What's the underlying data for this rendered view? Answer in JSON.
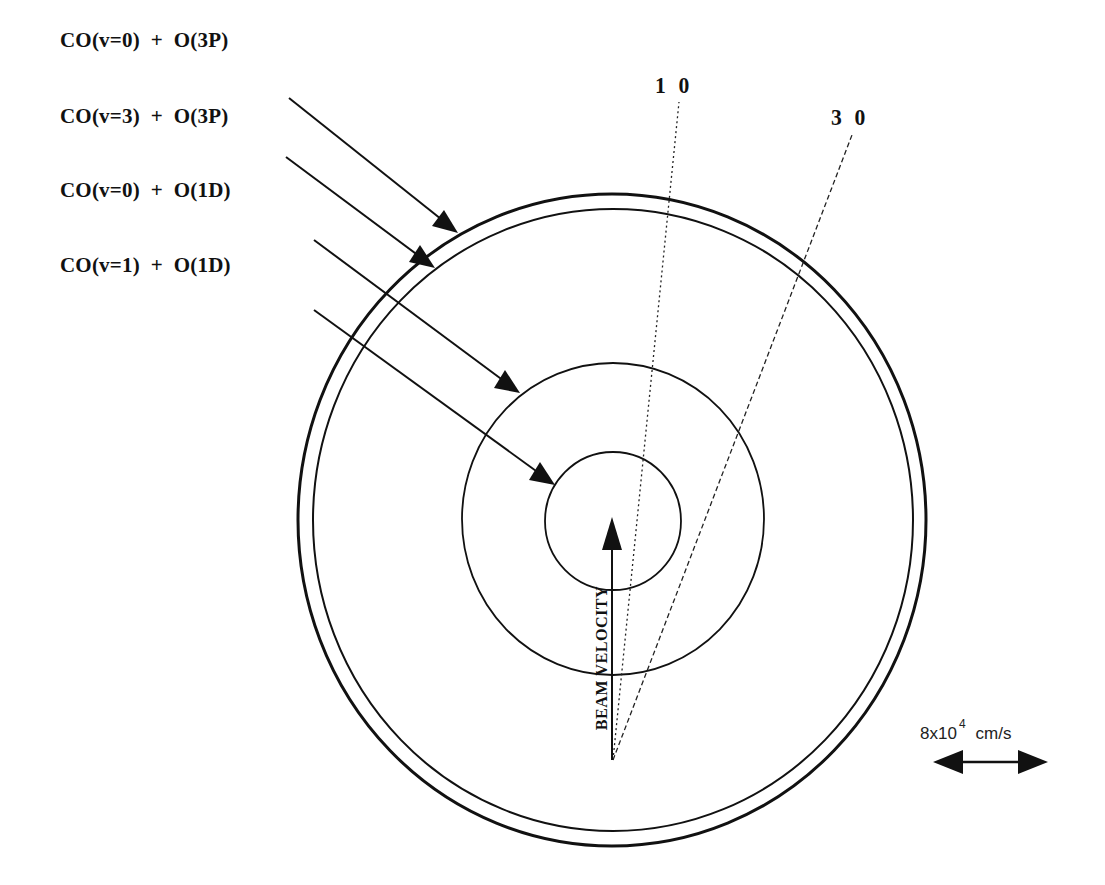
{
  "diagram": {
    "type": "newton-sphere-velocity-diagram",
    "channels": [
      {
        "label": "CO(v=0)  +  O(3P)",
        "ring": "outermost"
      },
      {
        "label": "CO(v=3)  +  O(3P)",
        "ring": "second"
      },
      {
        "label": "CO(v=0)  +  O(1D)",
        "ring": "middle"
      },
      {
        "label": "CO(v=1)  +  O(1D)",
        "ring": "innermost"
      }
    ],
    "angle_lines": [
      {
        "label": "1 0",
        "style": "dotted"
      },
      {
        "label": "3 0",
        "style": "dashed"
      }
    ],
    "beam_label": "BEAM VELOCITY",
    "scale_bar": {
      "mantissa": "8x10",
      "exponent": "4",
      "unit": "cm/s"
    },
    "colors": {
      "ink": "#111111",
      "background": "#ffffff"
    }
  }
}
